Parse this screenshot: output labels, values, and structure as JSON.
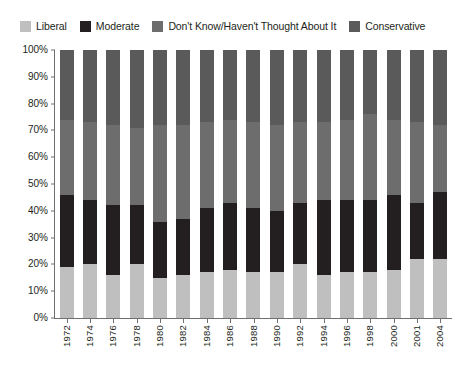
{
  "legend": {
    "position": "top-left",
    "items": [
      {
        "label": "Liberal",
        "color": "#bfbfbf",
        "name": "legend-liberal"
      },
      {
        "label": "Moderate",
        "color": "#231f20",
        "name": "legend-moderate"
      },
      {
        "label": "Don't Know/Haven't Thought About It",
        "color": "#6d6d6d",
        "name": "legend-dont-know"
      },
      {
        "label": "Conservative",
        "color": "#5a5a5a",
        "name": "legend-conservative"
      }
    ]
  },
  "chart_data": {
    "type": "bar",
    "stacked": true,
    "stack_total": 100,
    "title": "",
    "subtitle": "",
    "xlabel": "",
    "ylabel": "",
    "ylim": [
      0,
      100
    ],
    "grid": false,
    "legend_position": "top-left",
    "categories": [
      "1972",
      "1974",
      "1976",
      "1978",
      "1980",
      "1982",
      "1984",
      "1986",
      "1988",
      "1990",
      "1992",
      "1994",
      "1996",
      "1998",
      "2000",
      "2001",
      "2004"
    ],
    "ytick_labels": [
      "0%",
      "10%",
      "20%",
      "30%",
      "40%",
      "50%",
      "60%",
      "70%",
      "80%",
      "90%",
      "100%"
    ],
    "ytick_values": [
      0,
      10,
      20,
      30,
      40,
      50,
      60,
      70,
      80,
      90,
      100
    ],
    "series": [
      {
        "name": "Liberal",
        "color": "#bfbfbf",
        "values": [
          19,
          20,
          16,
          20,
          15,
          16,
          17,
          18,
          17,
          17,
          20,
          16,
          17,
          17,
          18,
          22,
          22
        ]
      },
      {
        "name": "Moderate",
        "color": "#231f20",
        "values": [
          27,
          24,
          26,
          22,
          21,
          21,
          24,
          25,
          24,
          23,
          23,
          28,
          27,
          27,
          28,
          21,
          25
        ]
      },
      {
        "name": "Don't Know/Haven't Thought About It",
        "color": "#6d6d6d",
        "values": [
          28,
          29,
          30,
          29,
          36,
          35,
          32,
          31,
          32,
          32,
          30,
          29,
          30,
          32,
          28,
          30,
          25
        ]
      },
      {
        "name": "Conservative",
        "color": "#5a5a5a",
        "values": [
          26,
          27,
          28,
          29,
          28,
          28,
          27,
          26,
          27,
          28,
          27,
          27,
          26,
          24,
          26,
          27,
          28
        ]
      }
    ]
  }
}
